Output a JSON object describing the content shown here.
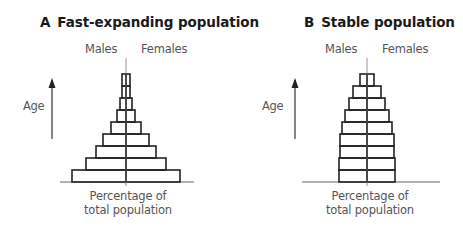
{
  "panels": [
    {
      "id": "A",
      "letter": "A",
      "title": "Fast-expanding population",
      "males_label": "Males",
      "females_label": "Females",
      "age_label": "Age",
      "xlabel_line1": "Percentage of",
      "xlabel_line2": "total population"
    },
    {
      "id": "B",
      "letter": "B",
      "title": "Stable population",
      "males_label": "Males",
      "females_label": "Females",
      "age_label": "Age",
      "xlabel_line1": "Percentage of",
      "xlabel_line2": "total population"
    }
  ],
  "chart_data": [
    {
      "type": "bar",
      "subtype": "population-pyramid",
      "title": "A Fast-expanding population",
      "xlabel": "Percentage of total population",
      "ylabel": "Age",
      "legend": [
        "Males",
        "Females"
      ],
      "age_groups_bottom_to_top": [
        1,
        2,
        3,
        4,
        5,
        6,
        7,
        8,
        9
      ],
      "series": [
        {
          "name": "Males",
          "values": [
            54,
            40,
            30,
            23,
            15,
            9,
            6,
            4,
            4
          ]
        },
        {
          "name": "Females",
          "values": [
            54,
            40,
            30,
            23,
            15,
            9,
            6,
            4,
            4
          ]
        }
      ],
      "note": "relative half-widths in px, no numeric axis shown"
    },
    {
      "type": "bar",
      "subtype": "population-pyramid",
      "title": "B Stable population",
      "xlabel": "Percentage of total population",
      "ylabel": "Age",
      "legend": [
        "Males",
        "Females"
      ],
      "age_groups_bottom_to_top": [
        1,
        2,
        3,
        4,
        5,
        6,
        7,
        8,
        9
      ],
      "series": [
        {
          "name": "Males",
          "values": [
            28,
            28,
            27,
            27,
            25,
            22,
            18,
            14,
            7
          ]
        },
        {
          "name": "Females",
          "values": [
            28,
            28,
            27,
            27,
            25,
            22,
            18,
            14,
            7
          ]
        }
      ],
      "note": "relative half-widths in px, no numeric axis shown"
    }
  ]
}
